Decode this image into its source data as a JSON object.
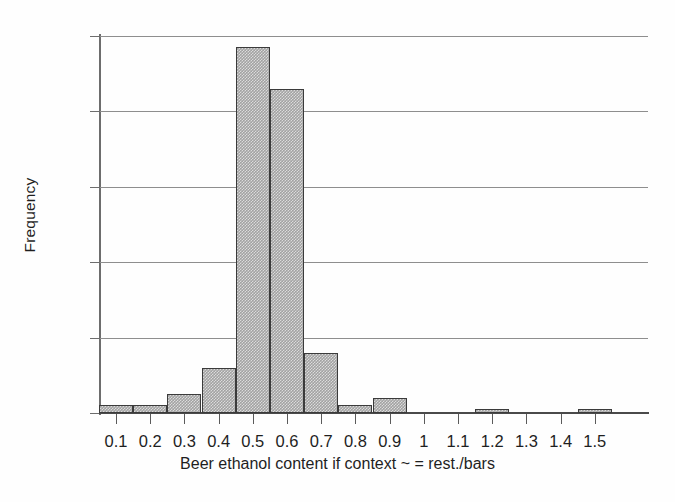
{
  "chart_data": {
    "type": "bar",
    "title": "",
    "subtitle": "",
    "xlabel": "Beer ethanol content if context ~ = rest./bars",
    "ylabel": "Frequency",
    "categories": [
      "0.1",
      "0.2",
      "0.3",
      "0.4",
      "0.5",
      "0.6",
      "0.7",
      "0.8",
      "0.9",
      "1",
      "1.1",
      "1.2",
      "1.3",
      "1.4",
      "1.5"
    ],
    "values": [
      2,
      2,
      5,
      12,
      97,
      86,
      16,
      2,
      4,
      0,
      0,
      1,
      0,
      0,
      1
    ],
    "xtick_labels": [
      "0.1",
      "0.2",
      "0.3",
      "0.4",
      "0.5",
      "0.6",
      "0.7",
      "0.8",
      "0.9",
      "1",
      "1.1",
      "1.2",
      "1.3",
      "1.4",
      "1.5"
    ],
    "ytick_labels": [
      "0",
      "20",
      "40",
      "60",
      "80",
      "100"
    ],
    "ytick_values": [
      0,
      20,
      40,
      60,
      80,
      100
    ],
    "ylim": [
      0,
      100
    ],
    "xlim": [
      0.05,
      1.62
    ],
    "grid": "horizontal",
    "legend": "none",
    "bar_fill_color": "#a2a2a2",
    "bar_edge_color": "#3b3b3b",
    "grid_color": "#8e8e8e",
    "axis_color": "#4a4a4a",
    "background_color": "#ffffff"
  }
}
